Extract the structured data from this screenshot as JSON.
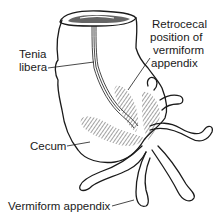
{
  "diagram": {
    "labels": {
      "tenia_line1": "Tenia",
      "tenia_line2": "libera",
      "retro_line1": "Retrocecal",
      "retro_line2": "position of",
      "retro_line3": "vermiform",
      "retro_line4": "appendix",
      "cecum": "Cecum",
      "appendix": "Vermiform appendix"
    },
    "colors": {
      "ink": "#1a1a1a",
      "background": "#ffffff"
    }
  }
}
